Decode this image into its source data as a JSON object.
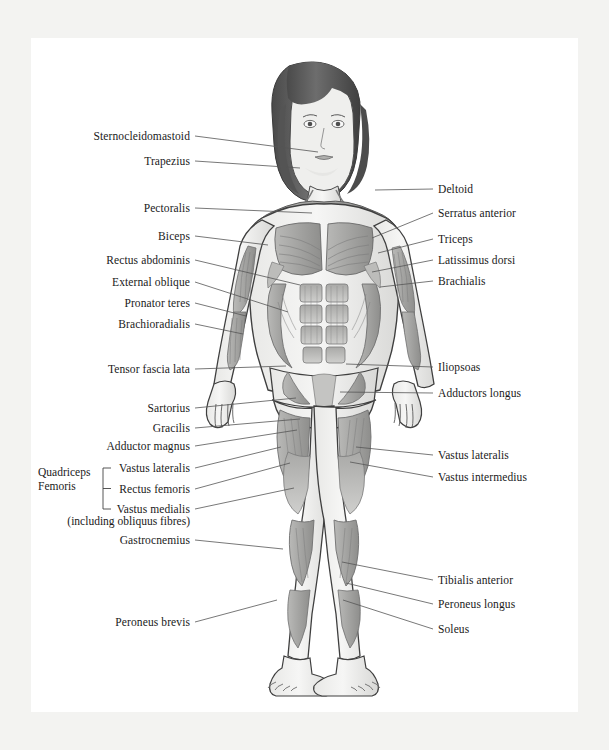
{
  "diagram": {
    "style": "grayscale medical illustration",
    "page_background": "#ffffff",
    "outer_background": "#f3f3f1",
    "text_color": "#1a1a1a",
    "leader_line_color": "#555555"
  },
  "labels_left": [
    {
      "text": "Sternocleidomastoid",
      "x": 190,
      "y": 136,
      "tx": 318,
      "ty": 152
    },
    {
      "text": "Trapezius",
      "x": 190,
      "y": 161,
      "tx": 300,
      "ty": 168
    },
    {
      "text": "Pectoralis",
      "x": 190,
      "y": 208,
      "tx": 312,
      "ty": 213
    },
    {
      "text": "Biceps",
      "x": 190,
      "y": 236,
      "tx": 268,
      "ty": 245
    },
    {
      "text": "Rectus abdominis",
      "x": 190,
      "y": 260,
      "tx": 300,
      "ty": 285
    },
    {
      "text": "External oblique",
      "x": 190,
      "y": 282,
      "tx": 288,
      "ty": 312
    },
    {
      "text": "Pronator teres",
      "x": 190,
      "y": 303,
      "tx": 246,
      "ty": 316
    },
    {
      "text": "Brachioradialis",
      "x": 190,
      "y": 324,
      "tx": 243,
      "ty": 334
    },
    {
      "text": "Tensor fascia lata",
      "x": 190,
      "y": 369,
      "tx": 286,
      "ty": 366
    },
    {
      "text": "Sartorius",
      "x": 190,
      "y": 408,
      "tx": 296,
      "ty": 398
    },
    {
      "text": "Gracilis",
      "x": 190,
      "y": 428,
      "tx": 300,
      "ty": 419
    },
    {
      "text": "Adductor magnus",
      "x": 190,
      "y": 446,
      "tx": 297,
      "ty": 430
    },
    {
      "text": "Vastus lateralis",
      "x": 190,
      "y": 468,
      "tx": 281,
      "ty": 447
    },
    {
      "text": "Rectus femoris",
      "x": 190,
      "y": 489,
      "tx": 290,
      "ty": 463
    },
    {
      "text": "Vastus medialis",
      "x": 190,
      "y": 509,
      "tx": 294,
      "ty": 488
    },
    {
      "text": "Gastrocnemius",
      "x": 190,
      "y": 540,
      "tx": 283,
      "ty": 549
    },
    {
      "text": "Peroneus brevis",
      "x": 190,
      "y": 622,
      "tx": 277,
      "ty": 600
    }
  ],
  "labels_left_note": {
    "text": "(including obliquus fibres)",
    "x": 190,
    "y": 521
  },
  "group_left": {
    "line1": "Quadriceps",
    "line2": "Femoris",
    "x": 38,
    "y": 479,
    "bracket_x": 103,
    "bracket_top": 468,
    "bracket_bottom": 509
  },
  "labels_right": [
    {
      "text": "Deltoid",
      "x": 438,
      "y": 189,
      "tx": 375,
      "ty": 190
    },
    {
      "text": "Serratus anterior",
      "x": 438,
      "y": 213,
      "tx": 372,
      "ty": 238
    },
    {
      "text": "Triceps",
      "x": 438,
      "y": 239,
      "tx": 378,
      "ty": 253
    },
    {
      "text": "Latissimus dorsi",
      "x": 438,
      "y": 260,
      "tx": 372,
      "ty": 272
    },
    {
      "text": "Brachialis",
      "x": 438,
      "y": 281,
      "tx": 380,
      "ty": 287
    },
    {
      "text": "Iliopsoas",
      "x": 438,
      "y": 367,
      "tx": 346,
      "ty": 364
    },
    {
      "text": "Adductors longus",
      "x": 438,
      "y": 393,
      "tx": 340,
      "ty": 392
    },
    {
      "text": "Vastus lateralis",
      "x": 438,
      "y": 455,
      "tx": 356,
      "ty": 447
    },
    {
      "text": "Vastus intermedius",
      "x": 438,
      "y": 477,
      "tx": 350,
      "ty": 462
    },
    {
      "text": "Tibialis anterior",
      "x": 438,
      "y": 580,
      "tx": 342,
      "ty": 562
    },
    {
      "text": "Peroneus longus",
      "x": 438,
      "y": 604,
      "tx": 346,
      "ty": 583
    },
    {
      "text": "Soleus",
      "x": 438,
      "y": 629,
      "tx": 343,
      "ty": 600
    }
  ],
  "muscle_names_all": [
    "Sternocleidomastoid",
    "Trapezius",
    "Pectoralis",
    "Biceps",
    "Rectus abdominis",
    "External oblique",
    "Pronator teres",
    "Brachioradialis",
    "Tensor fascia lata",
    "Sartorius",
    "Gracilis",
    "Adductor magnus",
    "Vastus lateralis",
    "Rectus femoris",
    "Vastus medialis",
    "Gastrocnemius",
    "Peroneus brevis",
    "Deltoid",
    "Serratus anterior",
    "Triceps",
    "Latissimus dorsi",
    "Brachialis",
    "Iliopsoas",
    "Adductors longus",
    "Vastus intermedius",
    "Tibialis anterior",
    "Peroneus longus",
    "Soleus"
  ]
}
